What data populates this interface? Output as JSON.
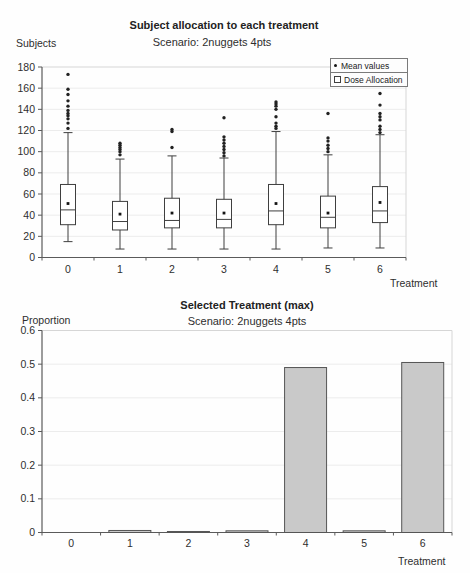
{
  "chart_data": [
    {
      "type": "boxplot",
      "title": "Subject allocation to each treatment",
      "subtitle": "Scenario: 2nuggets 4pts",
      "ylabel": "Subjects",
      "xlabel": "Treatment",
      "ylim": [
        0,
        180
      ],
      "ytick_step": 20,
      "grid": true,
      "legend_position": "top-right",
      "legend": [
        {
          "marker": "mean-dot",
          "label": "Mean values"
        },
        {
          "marker": "open-square",
          "label": "Dose Allocation"
        }
      ],
      "categories": [
        "0",
        "1",
        "2",
        "3",
        "4",
        "5",
        "6"
      ],
      "series": [
        {
          "category": "0",
          "whisker_low": 15,
          "q1": 31,
          "median": 45,
          "mean": 51,
          "q3": 69,
          "whisker_high": 118,
          "outliers": [
            122,
            127,
            131,
            134,
            136,
            139,
            143,
            148,
            154,
            159,
            173
          ]
        },
        {
          "category": "1",
          "whisker_low": 8,
          "q1": 26,
          "median": 34,
          "mean": 41,
          "q3": 53,
          "whisker_high": 93,
          "outliers": [
            97,
            100,
            102,
            104,
            106,
            108
          ]
        },
        {
          "category": "2",
          "whisker_low": 8,
          "q1": 28,
          "median": 35,
          "mean": 42,
          "q3": 56,
          "whisker_high": 96,
          "outliers": [
            104,
            119,
            121
          ]
        },
        {
          "category": "3",
          "whisker_low": 8,
          "q1": 28,
          "median": 36,
          "mean": 42,
          "q3": 55,
          "whisker_high": 94,
          "outliers": [
            96,
            99,
            102,
            105,
            108,
            111,
            114,
            132
          ]
        },
        {
          "category": "4",
          "whisker_low": 8,
          "q1": 31,
          "median": 44,
          "mean": 51,
          "q3": 69,
          "whisker_high": 119,
          "outliers": [
            122,
            124,
            127,
            133,
            140,
            143,
            145,
            147
          ]
        },
        {
          "category": "5",
          "whisker_low": 9,
          "q1": 28,
          "median": 38,
          "mean": 42,
          "q3": 58,
          "whisker_high": 97,
          "outliers": [
            100,
            103,
            106,
            110,
            113,
            136
          ]
        },
        {
          "category": "6",
          "whisker_low": 9,
          "q1": 33,
          "median": 44,
          "mean": 52,
          "q3": 67,
          "whisker_high": 116,
          "outliers": [
            118,
            121,
            124,
            130,
            133,
            136,
            144,
            155
          ]
        }
      ]
    },
    {
      "type": "bar",
      "title": "Selected Treatment (max)",
      "subtitle": "Scenario: 2nuggets 4pts",
      "ylabel": "Proportion",
      "xlabel": "Treatment",
      "ylim": [
        0,
        0.6
      ],
      "ytick_step": 0.1,
      "grid": true,
      "categories": [
        "0",
        "1",
        "2",
        "3",
        "4",
        "5",
        "6"
      ],
      "values": [
        0,
        0.006,
        0.003,
        0.005,
        0.49,
        0.005,
        0.505
      ],
      "bar_fill": "#c9c9c9",
      "bar_border": "#555555"
    }
  ],
  "colors": {
    "background": "#fefefe",
    "axis": "#5a5a5a",
    "frame_light": "#d6d6d6",
    "gridline": "#ececec",
    "box_stroke": "#3f3f3f",
    "mean_marker": "#151515",
    "text": "#2e2e2e"
  }
}
